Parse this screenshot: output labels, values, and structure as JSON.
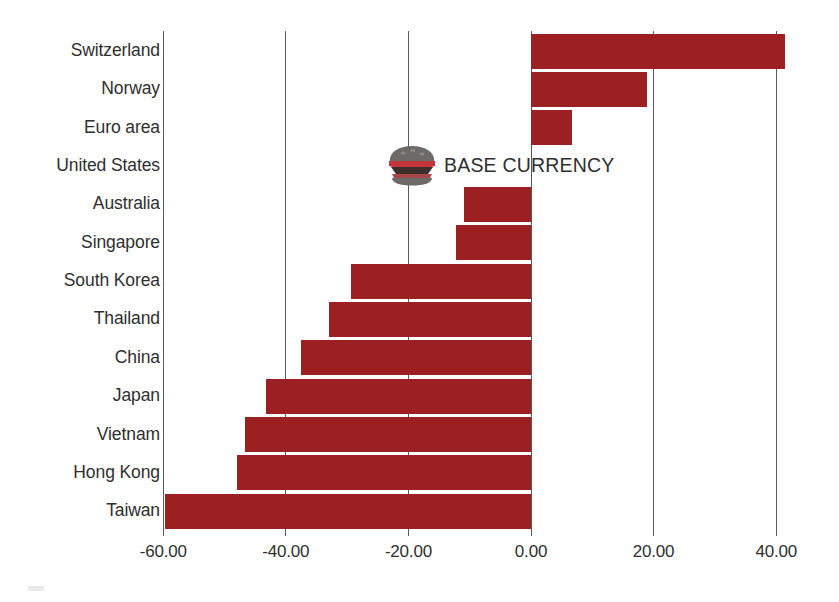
{
  "chart_data": {
    "type": "bar",
    "orientation": "horizontal",
    "title": "",
    "subtitle": "",
    "xlabel": "",
    "ylabel": "",
    "categories": [
      "Switzerland",
      "Norway",
      "Euro area",
      "United States",
      "Australia",
      "Singapore",
      "South Korea",
      "Thailand",
      "China",
      "Japan",
      "Vietnam",
      "Hong Kong",
      "Taiwan"
    ],
    "values": [
      41.5,
      19.0,
      6.7,
      0.0,
      -11.0,
      -12.3,
      -29.3,
      -33.0,
      -37.6,
      -43.3,
      -46.6,
      -47.9,
      -59.7
    ],
    "xlim": [
      -66.0,
      48.0
    ],
    "xticks": [
      -60,
      -40,
      -20,
      0,
      20,
      40
    ],
    "xtick_labels": [
      "-60.00",
      "-40.00",
      "-20.00",
      "0.00",
      "20.00",
      "40.00"
    ],
    "grid": "vertical-only",
    "legend": "none",
    "bar_color": "#9c2022",
    "gridline_color": "#59595b",
    "annotations": [
      {
        "text": "BASE CURRENCY",
        "icon": "hamburger-icon",
        "category": "United States",
        "value": 0.0
      }
    ]
  },
  "axis": {
    "ticks": [
      {
        "label": "-60.00",
        "value": -60
      },
      {
        "label": "-40.00",
        "value": -40
      },
      {
        "label": "-20.00",
        "value": -20
      },
      {
        "label": "0.00",
        "value": 0
      },
      {
        "label": "20.00",
        "value": 20
      },
      {
        "label": "40.00",
        "value": 40
      }
    ]
  },
  "rows": [
    {
      "label": "Switzerland",
      "value": 41.5
    },
    {
      "label": "Norway",
      "value": 19.0
    },
    {
      "label": "Euro area",
      "value": 6.7
    },
    {
      "label": "United States",
      "value": 0.0
    },
    {
      "label": "Australia",
      "value": -11.0
    },
    {
      "label": "Singapore",
      "value": -12.3
    },
    {
      "label": "South Korea",
      "value": -29.3
    },
    {
      "label": "Thailand",
      "value": -33.0
    },
    {
      "label": "China",
      "value": -37.6
    },
    {
      "label": "Japan",
      "value": -43.3
    },
    {
      "label": "Vietnam",
      "value": -46.6
    },
    {
      "label": "Hong Kong",
      "value": -47.9
    },
    {
      "label": "Taiwan",
      "value": -59.7
    }
  ],
  "annotation": {
    "base_currency_label": "BASE CURRENCY",
    "icon_name": "hamburger-icon"
  },
  "colors": {
    "bar": "#9c2022",
    "gridline": "#59595b",
    "text": "#2f2f2f",
    "background": "#ffffff",
    "burger_bun": "#6e6a68",
    "burger_tomato": "#c2353a",
    "burger_patty": "#3b2e2b"
  }
}
